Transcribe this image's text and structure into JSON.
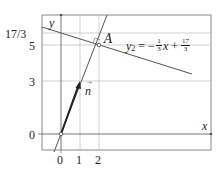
{
  "diagram": {
    "axes": {
      "x_label": "x",
      "y_label": "y"
    },
    "x_ticks": [
      "0",
      "1",
      "2"
    ],
    "y_ticks": [
      "0",
      "3",
      "5",
      "17/3"
    ],
    "vector": {
      "label": "n",
      "from": [
        0,
        0
      ],
      "to": [
        1,
        3
      ]
    },
    "point": {
      "label": "A",
      "coords": [
        2,
        5
      ]
    },
    "lines": [
      {
        "name": "normal-line",
        "equation": "y = 2.5x",
        "through": [
          [
            0,
            0
          ],
          [
            2,
            5
          ]
        ]
      },
      {
        "name": "y2",
        "equation_label": "y₂ = −⅓x + 17/3",
        "lhs": "y",
        "sub": "2",
        "eq": "=",
        "minus": "−",
        "frac1_num": "1",
        "frac1_den": "3",
        "var": "x",
        "plus": "+",
        "frac2_num": "17",
        "frac2_den": "3"
      }
    ],
    "colors": {
      "line": "#555555",
      "vector": "#222222",
      "grid": "#bbbbbb",
      "frame": "#888888"
    }
  }
}
